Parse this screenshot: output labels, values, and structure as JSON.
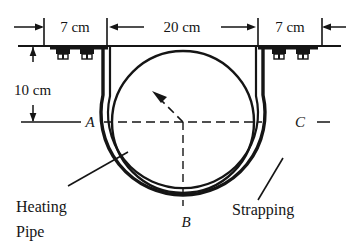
{
  "figure": {
    "colors": {
      "ink": "#151515",
      "background": "#ffffff"
    },
    "dimensions": {
      "left_gap": "7 cm",
      "pipe_width": "20 cm",
      "right_gap": "7 cm",
      "drop_height": "10 cm"
    },
    "points": {
      "a": "A",
      "b": "B",
      "c": "C"
    },
    "annotations": {
      "pipe_line1": "Heating",
      "pipe_line2": "Pipe",
      "strapping": "Strapping"
    }
  }
}
